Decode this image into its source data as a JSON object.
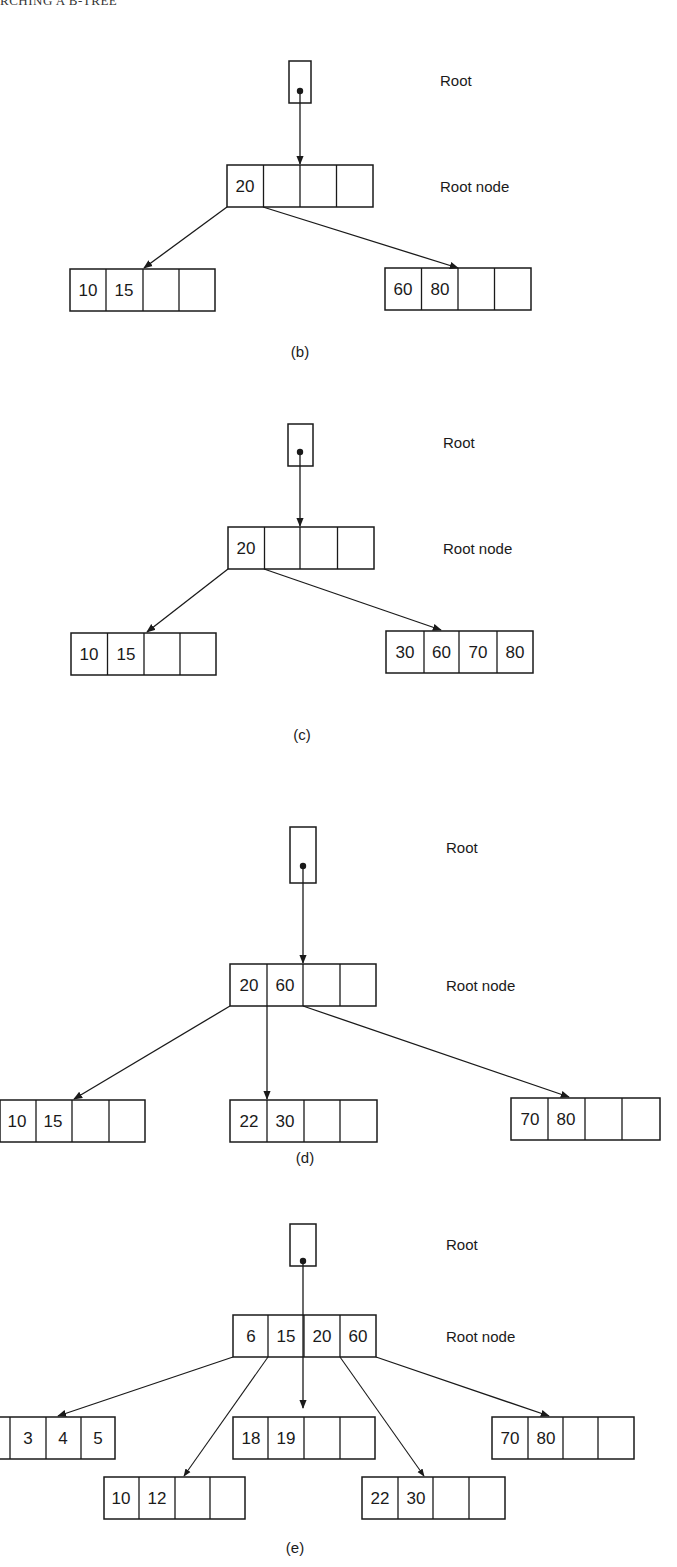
{
  "header": {
    "running_title": "RCHING A B-TREE"
  },
  "labels": {
    "root": "Root",
    "root_node": "Root node"
  },
  "figures": [
    {
      "caption": "(b)",
      "root_node_keys": [
        "20",
        "",
        "",
        ""
      ],
      "leaves": [
        {
          "keys": [
            "10",
            "15",
            "",
            ""
          ]
        },
        {
          "keys": [
            "60",
            "80",
            "",
            ""
          ]
        }
      ]
    },
    {
      "caption": "(c)",
      "root_node_keys": [
        "20",
        "",
        "",
        ""
      ],
      "leaves": [
        {
          "keys": [
            "10",
            "15",
            "",
            ""
          ]
        },
        {
          "keys": [
            "30",
            "60",
            "70",
            "80"
          ]
        }
      ]
    },
    {
      "caption": "(d)",
      "root_node_keys": [
        "20",
        "60",
        "",
        ""
      ],
      "leaves": [
        {
          "keys": [
            "10",
            "15",
            "",
            ""
          ]
        },
        {
          "keys": [
            "22",
            "30",
            "",
            ""
          ]
        },
        {
          "keys": [
            "70",
            "80",
            "",
            ""
          ]
        }
      ]
    },
    {
      "caption": "(e)",
      "root_node_keys": [
        "6",
        "15",
        "20",
        "60"
      ],
      "leaves": [
        {
          "keys": [
            "",
            "3",
            "4",
            "5"
          ]
        },
        {
          "keys": [
            "10",
            "12",
            "",
            ""
          ]
        },
        {
          "keys": [
            "18",
            "19",
            "",
            ""
          ]
        },
        {
          "keys": [
            "22",
            "30",
            "",
            ""
          ]
        },
        {
          "keys": [
            "70",
            "80",
            "",
            ""
          ]
        }
      ]
    }
  ],
  "colors": {
    "ink": "#1a1a1a",
    "background": "#ffffff"
  }
}
